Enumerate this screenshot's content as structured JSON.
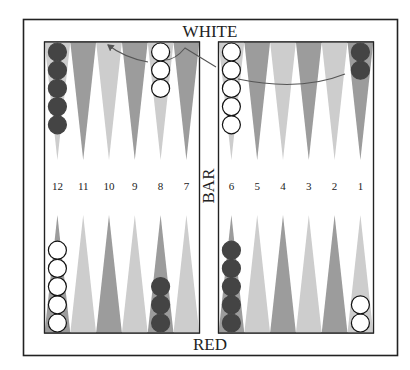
{
  "board": {
    "top_label": "WHITE",
    "bottom_label": "RED",
    "bar_label": "BAR",
    "colors": {
      "frame": "#222222",
      "background": "#ffffff",
      "point_dark": "#9c9c9c",
      "point_light": "#cdcdcd",
      "checker_dark": "#444444",
      "checker_light": "#ffffff",
      "arrow": "#555555"
    },
    "point_numbers_left": [
      "12",
      "11",
      "10",
      "9",
      "8",
      "7"
    ],
    "point_numbers_right": [
      "6",
      "5",
      "4",
      "3",
      "2",
      "1"
    ],
    "top_left_points": [
      {
        "point": "12",
        "shade": "light",
        "checkers": {
          "color": "dark",
          "count": 5
        }
      },
      {
        "point": "11",
        "shade": "dark",
        "checkers": {
          "color": "none",
          "count": 0
        }
      },
      {
        "point": "10",
        "shade": "light",
        "checkers": {
          "color": "none",
          "count": 0
        }
      },
      {
        "point": "9",
        "shade": "dark",
        "checkers": {
          "color": "none",
          "count": 0
        }
      },
      {
        "point": "8",
        "shade": "light",
        "checkers": {
          "color": "light",
          "count": 3
        }
      },
      {
        "point": "7",
        "shade": "dark",
        "checkers": {
          "color": "none",
          "count": 0
        }
      }
    ],
    "top_right_points": [
      {
        "point": "6",
        "shade": "light",
        "checkers": {
          "color": "light",
          "count": 5
        }
      },
      {
        "point": "5",
        "shade": "dark",
        "checkers": {
          "color": "none",
          "count": 0
        }
      },
      {
        "point": "4",
        "shade": "light",
        "checkers": {
          "color": "none",
          "count": 0
        }
      },
      {
        "point": "3",
        "shade": "dark",
        "checkers": {
          "color": "none",
          "count": 0
        }
      },
      {
        "point": "2",
        "shade": "light",
        "checkers": {
          "color": "none",
          "count": 0
        }
      },
      {
        "point": "1",
        "shade": "dark",
        "checkers": {
          "color": "dark",
          "count": 2
        }
      }
    ],
    "bottom_left_points": [
      {
        "point": "12",
        "shade": "dark",
        "checkers": {
          "color": "light",
          "count": 5
        }
      },
      {
        "point": "11",
        "shade": "light",
        "checkers": {
          "color": "none",
          "count": 0
        }
      },
      {
        "point": "10",
        "shade": "dark",
        "checkers": {
          "color": "none",
          "count": 0
        }
      },
      {
        "point": "9",
        "shade": "light",
        "checkers": {
          "color": "none",
          "count": 0
        }
      },
      {
        "point": "8",
        "shade": "dark",
        "checkers": {
          "color": "dark",
          "count": 3
        }
      },
      {
        "point": "7",
        "shade": "light",
        "checkers": {
          "color": "none",
          "count": 0
        }
      }
    ],
    "bottom_right_points": [
      {
        "point": "6",
        "shade": "dark",
        "checkers": {
          "color": "dark",
          "count": 5
        }
      },
      {
        "point": "5",
        "shade": "light",
        "checkers": {
          "color": "none",
          "count": 0
        }
      },
      {
        "point": "4",
        "shade": "dark",
        "checkers": {
          "color": "none",
          "count": 0
        }
      },
      {
        "point": "3",
        "shade": "light",
        "checkers": {
          "color": "none",
          "count": 0
        }
      },
      {
        "point": "2",
        "shade": "dark",
        "checkers": {
          "color": "none",
          "count": 0
        }
      },
      {
        "point": "1",
        "shade": "light",
        "checkers": {
          "color": "light",
          "count": 2
        }
      }
    ],
    "move_arrows": [
      {
        "description": "arc from top point 1 checker curving left toward top point 6 area"
      },
      {
        "description": "line from top point 6 area up to peak near bar, then arc to arrowhead at top point 10"
      }
    ]
  }
}
